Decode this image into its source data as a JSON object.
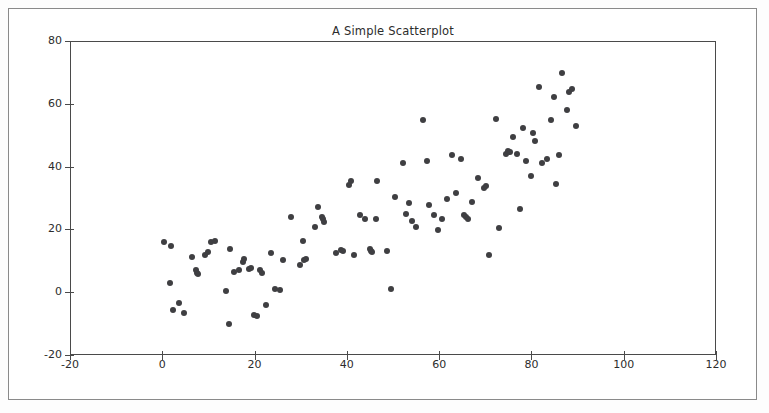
{
  "chart_data": {
    "type": "scatter",
    "title": "A Simple Scatterplot",
    "xlabel": "",
    "ylabel": "",
    "xlim": [
      -20,
      120
    ],
    "ylim": [
      -20,
      80
    ],
    "xticks": [
      -20,
      0,
      20,
      40,
      60,
      80,
      100,
      120
    ],
    "yticks": [
      -20,
      0,
      20,
      40,
      60,
      80
    ],
    "xtick_labels": [
      "-20",
      "0",
      "20",
      "40",
      "60",
      "80",
      "100",
      "120"
    ],
    "ytick_labels": [
      "-20",
      "0",
      "20",
      "40",
      "60",
      "80"
    ],
    "grid": false,
    "legend": null,
    "marker": "circle",
    "marker_color": "#3f3f42",
    "marker_size": 6,
    "n_points": 121,
    "series": [
      {
        "name": "points",
        "points": [
          [
            0.2,
            16.2
          ],
          [
            1.4,
            3.3
          ],
          [
            1.6,
            14.9
          ],
          [
            2.0,
            -5.2
          ],
          [
            3.3,
            -3.0
          ],
          [
            4.5,
            -6.3
          ],
          [
            6.2,
            11.6
          ],
          [
            7.0,
            7.5
          ],
          [
            7.3,
            6.5
          ],
          [
            7.6,
            6.0
          ],
          [
            9.0,
            12.3
          ],
          [
            9.6,
            13.0
          ],
          [
            10.4,
            16.3
          ],
          [
            11.2,
            16.7
          ],
          [
            13.6,
            0.6
          ],
          [
            14.2,
            -9.8
          ],
          [
            14.5,
            14.0
          ],
          [
            15.3,
            6.9
          ],
          [
            16.5,
            7.5
          ],
          [
            17.2,
            9.9
          ],
          [
            17.4,
            10.8
          ],
          [
            18.6,
            7.8
          ],
          [
            19.0,
            8.0
          ],
          [
            19.6,
            -7.0
          ],
          [
            20.3,
            -7.2
          ],
          [
            21.0,
            7.3
          ],
          [
            21.3,
            6.3
          ],
          [
            22.2,
            -3.8
          ],
          [
            23.3,
            12.8
          ],
          [
            24.2,
            1.4
          ],
          [
            25.3,
            0.9
          ],
          [
            26.0,
            10.5
          ],
          [
            27.6,
            24.4
          ],
          [
            29.6,
            9.0
          ],
          [
            30.2,
            16.6
          ],
          [
            30.6,
            10.7
          ],
          [
            31.0,
            10.9
          ],
          [
            32.8,
            21.2
          ],
          [
            33.6,
            27.5
          ],
          [
            34.4,
            24.3
          ],
          [
            34.6,
            23.6
          ],
          [
            34.9,
            22.6
          ],
          [
            37.5,
            12.8
          ],
          [
            38.5,
            13.6
          ],
          [
            39.0,
            13.5
          ],
          [
            40.2,
            34.4
          ],
          [
            40.6,
            35.8
          ],
          [
            41.4,
            12.3
          ],
          [
            42.6,
            24.8
          ],
          [
            43.8,
            23.5
          ],
          [
            44.8,
            14.0
          ],
          [
            45.0,
            13.5
          ],
          [
            45.3,
            13.0
          ],
          [
            46.0,
            23.5
          ],
          [
            46.3,
            35.8
          ],
          [
            48.5,
            13.5
          ],
          [
            49.4,
            1.2
          ],
          [
            50.2,
            30.7
          ],
          [
            52.0,
            41.5
          ],
          [
            52.6,
            25.3
          ],
          [
            53.2,
            28.7
          ],
          [
            54.0,
            23.0
          ],
          [
            54.8,
            21.1
          ],
          [
            56.2,
            55.3
          ],
          [
            57.2,
            42.0
          ],
          [
            57.5,
            28.0
          ],
          [
            58.6,
            25.0
          ],
          [
            59.6,
            20.2
          ],
          [
            60.4,
            23.5
          ],
          [
            61.4,
            30.0
          ],
          [
            62.5,
            44.0
          ],
          [
            63.4,
            31.8
          ],
          [
            64.6,
            42.6
          ],
          [
            65.2,
            25.0
          ],
          [
            65.6,
            24.3
          ],
          [
            66.0,
            23.6
          ],
          [
            67.0,
            29.0
          ],
          [
            68.3,
            36.6
          ],
          [
            69.5,
            33.5
          ],
          [
            70.0,
            34.0
          ],
          [
            70.6,
            12.3
          ],
          [
            72.0,
            55.5
          ],
          [
            72.8,
            20.8
          ],
          [
            74.2,
            44.4
          ],
          [
            74.8,
            45.3
          ],
          [
            75.2,
            45.0
          ],
          [
            75.8,
            49.6
          ],
          [
            76.6,
            44.3
          ],
          [
            77.2,
            26.9
          ],
          [
            78.0,
            52.5
          ],
          [
            78.6,
            42.0
          ],
          [
            79.6,
            37.2
          ],
          [
            80.2,
            51.0
          ],
          [
            80.6,
            48.4
          ],
          [
            81.4,
            65.8
          ],
          [
            82.0,
            41.5
          ],
          [
            83.2,
            42.6
          ],
          [
            84.0,
            55.3
          ],
          [
            84.6,
            62.6
          ],
          [
            85.2,
            34.7
          ],
          [
            85.8,
            44.0
          ],
          [
            86.4,
            70.2
          ],
          [
            87.5,
            58.3
          ],
          [
            88.0,
            64.0
          ],
          [
            88.6,
            64.9
          ],
          [
            89.4,
            53.4
          ]
        ]
      }
    ]
  }
}
